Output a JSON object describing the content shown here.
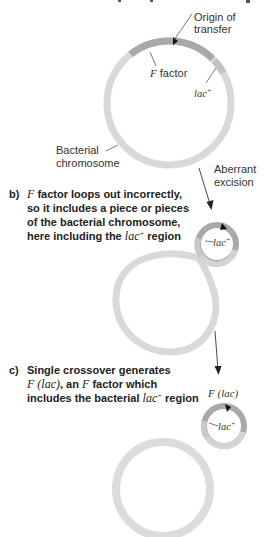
{
  "colors": {
    "chromosome": "#d9d9d9",
    "f_factor": "#a9a9a9",
    "lac_region": "#c2c2c2",
    "text": "#222222",
    "arrow": "#333333"
  },
  "panel_a": {
    "heading_cutoff": "a) F factor integrated into the bacterial chromosome",
    "origin_label_line1": "Origin of",
    "origin_label_line2": "transfer",
    "f_factor_label_italic": "F",
    "f_factor_label_rest": " factor",
    "lac_label": "lac",
    "lac_sup": "+",
    "chromosome_label_line1": "Bacterial",
    "chromosome_label_line2": "chromosome",
    "transition_label_line1": "Aberrant",
    "transition_label_line2": "excision"
  },
  "panel_b": {
    "marker": "b)",
    "line1_italic": "F",
    "line1_rest": " factor loops out incorrectly,",
    "line2": "so it includes a piece or pieces",
    "line3": "of the bacterial chromosome,",
    "line4_start": "here including the ",
    "line4_italic": "lac",
    "line4_sup": "+",
    "line4_end": " region",
    "lac_label": "lac",
    "lac_sup": "+"
  },
  "panel_c": {
    "marker": "c)",
    "line1": "Single crossover generates",
    "line2_italic_a": "F  (lac)",
    "line2_mid": ", an ",
    "line2_italic_b": "F",
    "line2_end": " factor which",
    "line3_start": "includes the bacterial ",
    "line3_italic": "lac",
    "line3_sup": "+",
    "line3_end": " region",
    "plasmid_label": "F  (lac)",
    "lac_label": "lac",
    "lac_sup": "+"
  }
}
